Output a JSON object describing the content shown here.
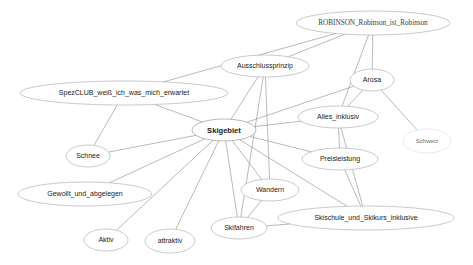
{
  "diagram": {
    "type": "node-link-network",
    "title": "",
    "background_color": "#ffffff",
    "node_fill": "#ffffff",
    "node_stroke": "#a6a6a6",
    "edge_color": "#8c8c8c",
    "label_color": "#1a1a1a",
    "nodes": [
      {
        "id": "robinson",
        "label": "ROBINSON_Robinson_ist_Robinson",
        "cx": 373,
        "cy": 23,
        "rx": 77,
        "ry": 12,
        "font_size": 7.2,
        "style": "serif",
        "central": false
      },
      {
        "id": "ausschlussprinzip",
        "label": "Ausschlussprinzip",
        "cx": 265,
        "cy": 66,
        "rx": 44,
        "ry": 11,
        "font_size": 7,
        "style": "sans",
        "central": false
      },
      {
        "id": "arosa",
        "label": "Arosa",
        "cx": 372,
        "cy": 80,
        "rx": 22,
        "ry": 11,
        "font_size": 7,
        "style": "sans",
        "central": false
      },
      {
        "id": "spezclub",
        "label": "SpezCLUB_weiß_ich_was_mich_erwartet",
        "cx": 124,
        "cy": 93,
        "rx": 104,
        "ry": 12,
        "font_size": 7,
        "style": "sans",
        "central": false
      },
      {
        "id": "alles_inklusiv",
        "label": "Alles_inklusiv",
        "cx": 338,
        "cy": 117,
        "rx": 40,
        "ry": 11,
        "font_size": 7,
        "style": "sans",
        "central": false
      },
      {
        "id": "schweiz",
        "label": "Schweiz",
        "cx": 427,
        "cy": 141,
        "rx": 24,
        "ry": 12,
        "font_size": 6,
        "style": "faint",
        "central": false
      },
      {
        "id": "skigebiet",
        "label": "Skigebiet",
        "cx": 224,
        "cy": 130,
        "rx": 32,
        "ry": 11,
        "font_size": 7.6,
        "style": "sans",
        "central": true
      },
      {
        "id": "preisleistung",
        "label": "Preisleistung",
        "cx": 340,
        "cy": 159,
        "rx": 38,
        "ry": 11,
        "font_size": 7,
        "style": "sans",
        "central": false
      },
      {
        "id": "schnee",
        "label": "Schnee",
        "cx": 88,
        "cy": 156,
        "rx": 22,
        "ry": 11,
        "font_size": 7,
        "style": "sans",
        "central": false
      },
      {
        "id": "gewollt",
        "label": "Gewollt_und_abgelegen",
        "cx": 85,
        "cy": 194,
        "rx": 67,
        "ry": 12,
        "font_size": 7,
        "style": "sans",
        "central": false
      },
      {
        "id": "wandern",
        "label": "Wandern",
        "cx": 270,
        "cy": 190,
        "rx": 29,
        "ry": 11,
        "font_size": 7,
        "style": "sans",
        "central": false
      },
      {
        "id": "skischule",
        "label": "Skischule_und_Skikurs_inklusive",
        "cx": 366,
        "cy": 218,
        "rx": 88,
        "ry": 12,
        "font_size": 7,
        "style": "sans",
        "central": false
      },
      {
        "id": "skifahren",
        "label": "Skifahren",
        "cx": 239,
        "cy": 228,
        "rx": 28,
        "ry": 11,
        "font_size": 7,
        "style": "sans",
        "central": false
      },
      {
        "id": "aktiv",
        "label": "Aktiv",
        "cx": 106,
        "cy": 240,
        "rx": 22,
        "ry": 11,
        "font_size": 7,
        "style": "sans",
        "central": false
      },
      {
        "id": "attraktiv",
        "label": "attraktiv",
        "cx": 170,
        "cy": 241,
        "rx": 25,
        "ry": 12,
        "font_size": 7,
        "style": "sans",
        "central": false
      }
    ],
    "edges": [
      {
        "source": "robinson",
        "target": "spezclub"
      },
      {
        "source": "robinson",
        "target": "ausschlussprinzip"
      },
      {
        "source": "robinson",
        "target": "alles_inklusiv"
      },
      {
        "source": "robinson",
        "target": "arosa"
      },
      {
        "source": "arosa",
        "target": "alles_inklusiv"
      },
      {
        "source": "arosa",
        "target": "schweiz"
      },
      {
        "source": "arosa",
        "target": "skigebiet"
      },
      {
        "source": "spezclub",
        "target": "skigebiet"
      },
      {
        "source": "spezclub",
        "target": "schnee"
      },
      {
        "source": "ausschlussprinzip",
        "target": "skigebiet"
      },
      {
        "source": "ausschlussprinzip",
        "target": "wandern"
      },
      {
        "source": "ausschlussprinzip",
        "target": "skifahren"
      },
      {
        "source": "skigebiet",
        "target": "alles_inklusiv"
      },
      {
        "source": "skigebiet",
        "target": "preisleistung"
      },
      {
        "source": "skigebiet",
        "target": "schnee"
      },
      {
        "source": "skigebiet",
        "target": "gewollt"
      },
      {
        "source": "skigebiet",
        "target": "wandern"
      },
      {
        "source": "skigebiet",
        "target": "skifahren"
      },
      {
        "source": "skigebiet",
        "target": "skischule"
      },
      {
        "source": "skigebiet",
        "target": "aktiv"
      },
      {
        "source": "skigebiet",
        "target": "attraktiv"
      },
      {
        "source": "alles_inklusiv",
        "target": "preisleistung"
      },
      {
        "source": "alles_inklusiv",
        "target": "skischule"
      },
      {
        "source": "preisleistung",
        "target": "skischule"
      },
      {
        "source": "wandern",
        "target": "skifahren"
      },
      {
        "source": "skifahren",
        "target": "skischule"
      }
    ]
  }
}
